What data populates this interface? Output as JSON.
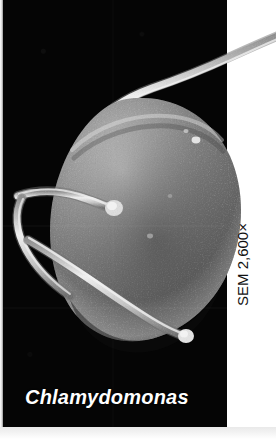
{
  "figure": {
    "type": "scanning-electron-micrograph",
    "caption": "Chlamydomonas",
    "magnification_label": "SEM 2,600×",
    "magnification_value": "2,600",
    "microscopy_technique": "SEM",
    "plate_background_color": "#050505",
    "page_background_color": "#ffffff",
    "caption_color": "#ffffff",
    "magnification_text_color": "#111111",
    "specimen": {
      "name": "Chlamydomonas",
      "body_shape": "rounded-ovoid-cell",
      "flagella_count": 2
    }
  }
}
